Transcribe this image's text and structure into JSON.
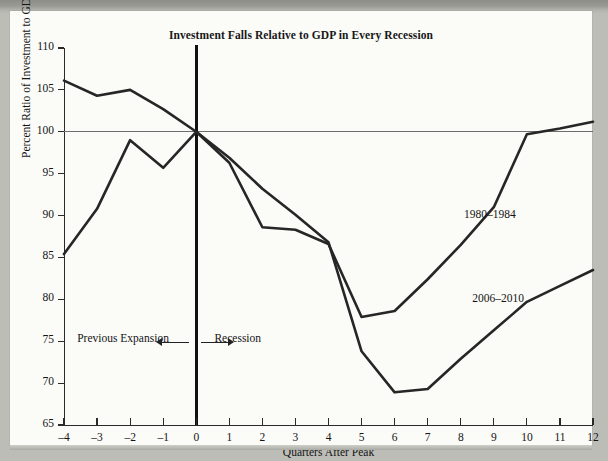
{
  "chart_data": {
    "type": "line",
    "title": "Investment Falls Relative to GDP in Every Recession",
    "xlabel": "Quarters After Peak",
    "ylabel": "Percent Ratio of Investment to GDP, Indexed to Peak",
    "xlim": [
      -4,
      12
    ],
    "ylim": [
      65,
      110
    ],
    "ytick_step": 5,
    "xtick_step": 1,
    "grid": false,
    "legend": "inline-annotations",
    "reference_lines": [
      {
        "name": "index-100-line",
        "axis": "y",
        "value": 100
      },
      {
        "name": "recession-start-line",
        "axis": "x",
        "value": 0
      }
    ],
    "x": [
      -4,
      -3,
      -2,
      -1,
      0,
      1,
      2,
      3,
      4,
      5,
      6,
      7,
      8,
      9,
      10,
      11,
      12
    ],
    "xticklabels": [
      "–4",
      "–3",
      "–2",
      "–1",
      "0",
      "1",
      "2",
      "3",
      "4",
      "5",
      "6",
      "7",
      "8",
      "9",
      "10",
      "11",
      "12"
    ],
    "yticklabels": [
      "65",
      "70",
      "75",
      "80",
      "85",
      "90",
      "95",
      "100",
      "105",
      "110"
    ],
    "yticks": [
      65,
      70,
      75,
      80,
      85,
      90,
      95,
      100,
      105,
      110
    ],
    "series": [
      {
        "name": "1980–1984",
        "label": "1980–1984",
        "color": "#262626",
        "values": [
          85.4,
          90.8,
          99.0,
          95.7,
          100.0,
          96.3,
          88.6,
          88.3,
          86.6,
          77.9,
          78.6,
          82.4,
          86.5,
          91.0,
          99.7,
          100.4,
          101.2
        ]
      },
      {
        "name": "2006–2010",
        "label": "2006–2010",
        "color": "#262626",
        "values": [
          106.1,
          104.3,
          105.0,
          102.7,
          100.0,
          96.9,
          93.2,
          90.1,
          86.8,
          73.8,
          68.9,
          69.3,
          72.9,
          76.3,
          79.7,
          81.6,
          83.5
        ]
      }
    ],
    "annotations": [
      {
        "name": "label-1980-1984",
        "text": "1980–1984",
        "x": 8.1,
        "y": 90.0
      },
      {
        "name": "label-2006-2010",
        "text": "2006–2010",
        "x": 8.35,
        "y": 79.9
      },
      {
        "name": "previous-expansion",
        "text": "Previous Expansion",
        "x": -3.6,
        "y": 75.1
      },
      {
        "name": "recession",
        "text": "Recession",
        "x": 0.55,
        "y": 75.1
      }
    ]
  },
  "figure": {
    "title": "Investment Falls Relative to GDP in Every Recession",
    "axis": {
      "x_title": "Quarters After Peak",
      "y_title": "Percent Ratio of Investment to GDP, Indexed to Peak"
    },
    "annotations": {
      "previous_expansion": "Previous Expansion",
      "recession": "Recession",
      "series_upper": "1980–1984",
      "series_lower": "2006–2010"
    }
  }
}
